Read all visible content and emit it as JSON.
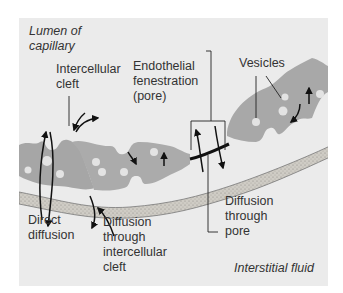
{
  "diagram": {
    "colors": {
      "panel_bg": "#ebebeb",
      "cell_fill": "#a8a8a8",
      "cell_light": "#bdbdbd",
      "vesicle_fill": "#e6e6e6",
      "basement_membrane": "#c9c6bf",
      "arrow": "#111111",
      "text": "#333333"
    },
    "regions": {
      "lumen": "Lumen of\ncapillary",
      "interstitial": "Interstitial fluid"
    },
    "labels": {
      "intercellular_cleft": "Intercellular\ncleft",
      "endothelial_fenestration": "Endothelial\nfenestration\n(pore)",
      "vesicles": "Vesicles",
      "direct_diffusion": "Direct\ndiffusion",
      "diffusion_cleft": "Diffusion\nthrough\nintercellular\ncleft",
      "diffusion_pore": "Diffusion\nthrough\npore"
    },
    "structures": [
      {
        "name": "endothelial-cell-left",
        "vesicles": 3
      },
      {
        "name": "endothelial-cell-middle",
        "vesicles": 4
      },
      {
        "name": "endothelial-cell-right",
        "vesicles": 4
      },
      {
        "name": "basement-membrane"
      },
      {
        "name": "fenestration-pore"
      }
    ],
    "arrows": [
      {
        "name": "direct-diffusion-arrows",
        "count": 2,
        "direction": "bidirectional across wall"
      },
      {
        "name": "cleft-arrows",
        "count": 3,
        "direction": "into and out of cleft"
      },
      {
        "name": "pore-arrows",
        "count": 2,
        "direction": "bidirectional through pore"
      },
      {
        "name": "vesicle-arrows",
        "count": 4,
        "direction": "transcytosis within cells"
      }
    ]
  }
}
